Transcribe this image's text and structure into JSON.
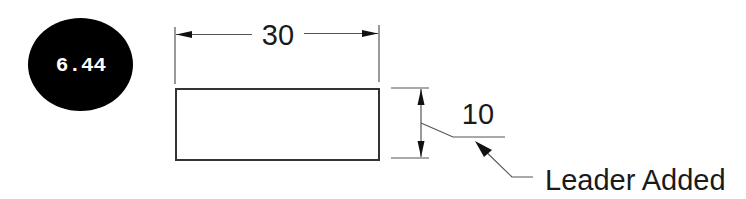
{
  "badge": {
    "label": "6.44",
    "background_color": "#000000",
    "text_color": "#ffffff"
  },
  "drawing": {
    "shape": "rectangle",
    "horizontal_dimension": {
      "value": "30"
    },
    "vertical_dimension": {
      "value": "10"
    },
    "annotation": {
      "text": "Leader Added"
    },
    "line_color": "#555555"
  }
}
